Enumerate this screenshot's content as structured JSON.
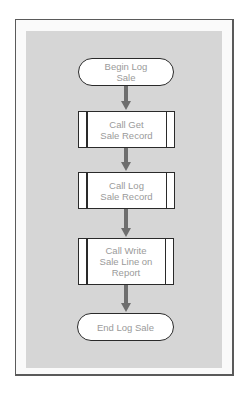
{
  "diagram": {
    "type": "flowchart",
    "nodes": [
      {
        "id": "begin",
        "shape": "terminal",
        "label": "Begin Log\nSale"
      },
      {
        "id": "get",
        "shape": "predefined-process",
        "label": "Call Get\nSale Record"
      },
      {
        "id": "log",
        "shape": "predefined-process",
        "label": "Call Log\nSale Record"
      },
      {
        "id": "write",
        "shape": "predefined-process",
        "label": "Call Write\nSale Line on\nReport"
      },
      {
        "id": "end",
        "shape": "terminal",
        "label": "End Log Sale"
      }
    ],
    "edges": [
      {
        "from": "begin",
        "to": "get"
      },
      {
        "from": "get",
        "to": "log"
      },
      {
        "from": "log",
        "to": "write"
      },
      {
        "from": "write",
        "to": "end"
      }
    ],
    "colors": {
      "panel": "#d6d6d6",
      "frame_border": "#5a5a5a",
      "node_border": "#2a2a2a",
      "node_text": "#9a9a9a",
      "arrow": "#6e6e6e"
    }
  }
}
